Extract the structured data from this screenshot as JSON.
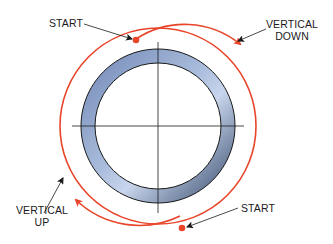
{
  "diagram": {
    "labels": {
      "start_top": "START",
      "vertical_down_1": "VERTICAL",
      "vertical_down_2": "DOWN",
      "vertical_up_1": "VERTICAL",
      "vertical_up_2": "UP",
      "start_bottom": "START"
    },
    "colors": {
      "red": "#e8452a",
      "ring_light": "#c7d3ea",
      "ring_dark": "#2e3f5e",
      "line": "#1a1a1a"
    }
  }
}
